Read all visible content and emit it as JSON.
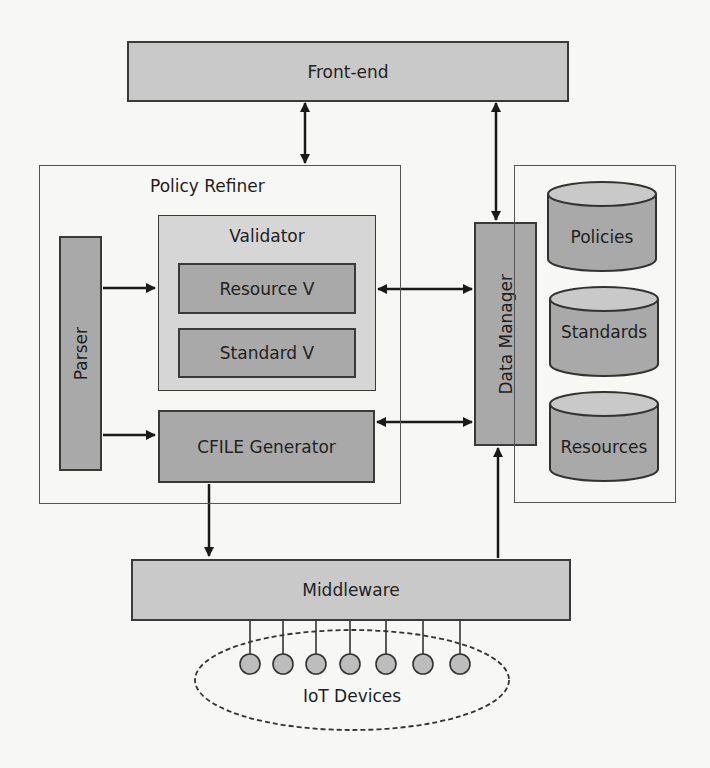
{
  "diagram": {
    "frontend": {
      "label": "Front-end"
    },
    "policy_refiner": {
      "label": "Policy Refiner",
      "parser": {
        "label": "Parser"
      },
      "validator": {
        "label": "Validator",
        "resource_v": {
          "label": "Resource V"
        },
        "standard_v": {
          "label": "Standard V"
        }
      },
      "cfile_generator": {
        "label": "CFILE Generator"
      }
    },
    "data_manager": {
      "label": "Data Manager"
    },
    "databases": [
      {
        "label": "Policies"
      },
      {
        "label": "Standards"
      },
      {
        "label": "Resources"
      }
    ],
    "middleware": {
      "label": "Middleware"
    },
    "iot": {
      "label": "IoT Devices",
      "device_count": 7
    },
    "connections": [
      {
        "from": "Front-end",
        "to": "Policy Refiner",
        "type": "bidirectional"
      },
      {
        "from": "Front-end",
        "to": "Data Manager",
        "type": "bidirectional"
      },
      {
        "from": "Parser",
        "to": "Validator",
        "type": "directed"
      },
      {
        "from": "Parser",
        "to": "CFILE Generator",
        "type": "directed"
      },
      {
        "from": "Validator",
        "to": "Data Manager",
        "type": "bidirectional"
      },
      {
        "from": "CFILE Generator",
        "to": "Data Manager",
        "type": "bidirectional"
      },
      {
        "from": "CFILE Generator",
        "to": "Middleware",
        "type": "directed"
      },
      {
        "from": "Middleware",
        "to": "Data Manager",
        "type": "directed"
      },
      {
        "from": "Middleware",
        "to": "IoT Devices",
        "type": "line"
      }
    ],
    "colors": {
      "dark_box": "#a9a9a9",
      "light_box": "#c9c9c9",
      "validator_bg": "#d6d6d6",
      "border": "#3a3a3a",
      "background": "#f7f7f5"
    }
  }
}
